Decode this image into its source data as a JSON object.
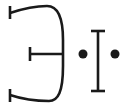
{
  "diagram": {
    "type": "symbol-glyph",
    "stroke_color": "#1a1a1a",
    "background": "#ffffff",
    "elements": [
      {
        "name": "curved-bracket-with-terminals",
        "description": "Reversed curved bracket with three T-terminated stubs (top, middle, bottom)"
      },
      {
        "name": "left-dot"
      },
      {
        "name": "i-beam"
      },
      {
        "name": "right-dot"
      }
    ]
  }
}
